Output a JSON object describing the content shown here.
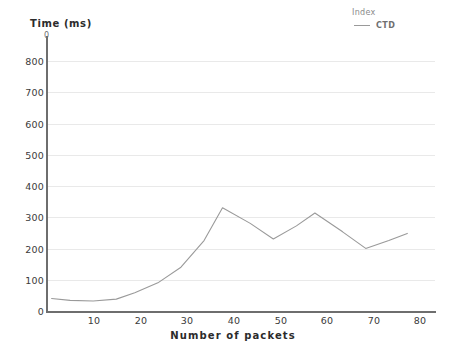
{
  "chart_data": {
    "type": "line",
    "title": "",
    "xlabel": "Number of packets",
    "ylabel": "Time (ms)",
    "xlim": [
      0,
      84
    ],
    "ylim": [
      0,
      850
    ],
    "grid": true,
    "legend_position": "top-right",
    "legend_title": "Index",
    "x_ticks": [
      10,
      20,
      30,
      40,
      50,
      60,
      70,
      80
    ],
    "y_ticks": [
      0,
      100,
      200,
      300,
      400,
      500,
      600,
      700,
      800
    ],
    "origin_label": "0",
    "series": [
      {
        "name": "CTD",
        "color": "#9a9a9a",
        "x": [
          1,
          5,
          10,
          15,
          19,
          24,
          29,
          34,
          38,
          44,
          49,
          54,
          58,
          64,
          69,
          74,
          78
        ],
        "values": [
          40,
          34,
          32,
          38,
          58,
          90,
          140,
          225,
          330,
          280,
          230,
          272,
          313,
          253,
          200,
          225,
          248
        ]
      }
    ]
  },
  "legend": {
    "title": "Index",
    "entries": [
      {
        "label": "CTD",
        "color": "#9a9a9a"
      }
    ]
  },
  "axes": {
    "y_title": "Time (ms)",
    "x_title": "Number of packets",
    "y_origin_mark": "0",
    "y_tick_labels": [
      "800",
      "700",
      "600",
      "500",
      "400",
      "300",
      "200",
      "100",
      "0"
    ],
    "x_tick_labels": [
      "10",
      "20",
      "30",
      "40",
      "50",
      "60",
      "70",
      "80"
    ]
  }
}
